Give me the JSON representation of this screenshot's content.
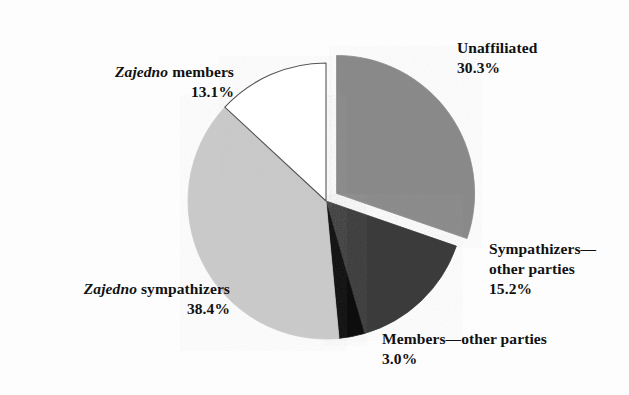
{
  "figure": {
    "background_color": "#fdfdfd",
    "text_color": "#111111"
  },
  "chart_data": {
    "type": "pie",
    "title": "",
    "subtitle": "",
    "xlabel": "",
    "ylabel": "",
    "legend_position": "none",
    "grid": false,
    "units": "percent",
    "total": 100.0,
    "start_angle_deg": 0,
    "direction": "clockwise",
    "categories": [
      "Unaffiliated",
      "Sympathizers—other parties",
      "Members—other parties",
      "Zajedno sympathizers",
      "Zajedno members"
    ],
    "values": [
      30.3,
      15.2,
      3.0,
      38.4,
      13.1
    ],
    "slices": [
      {
        "name": "unaffiliated",
        "label_line1": "Unaffiliated",
        "label_emphasis": "",
        "value": 30.3,
        "value_text": "30.3%",
        "color": "#898989",
        "stroke": "#898989",
        "exploded": true,
        "start_deg": 0.0,
        "end_deg": 109.08
      },
      {
        "name": "sympathizers-other-parties",
        "label_line1": "Sympathizers—",
        "label_line2": "other parties",
        "label_emphasis": "",
        "value": 15.2,
        "value_text": "15.2%",
        "color": "#3a3a3a",
        "stroke": "#3a3a3a",
        "exploded": false,
        "start_deg": 109.08,
        "end_deg": 163.8
      },
      {
        "name": "members-other-parties",
        "label_line1": "Members—other parties",
        "label_emphasis": "",
        "value": 3.0,
        "value_text": "3.0%",
        "color": "#111111",
        "stroke": "#111111",
        "exploded": false,
        "start_deg": 163.8,
        "end_deg": 174.6
      },
      {
        "name": "zajedno-sympathizers",
        "label_emphasis": "Zajedno",
        "label_line1": " sympathizers",
        "value": 38.4,
        "value_text": "38.4%",
        "color": "#c9c9c9",
        "stroke": "#c9c9c9",
        "exploded": false,
        "start_deg": 174.6,
        "end_deg": 312.84
      },
      {
        "name": "zajedno-members",
        "label_emphasis": "Zajedno",
        "label_line1": " members",
        "value": 13.1,
        "value_text": "13.1%",
        "color": "#ffffff",
        "stroke": "#555555",
        "exploded": false,
        "start_deg": 312.84,
        "end_deg": 360.0
      }
    ]
  },
  "labels": {
    "unaffiliated": {
      "text": "Unaffiliated",
      "pct": "30.3%"
    },
    "zajedno_members": {
      "emph": "Zajedno",
      "text": " members",
      "pct": "13.1%"
    },
    "zajedno_sympathizers": {
      "emph": "Zajedno",
      "text": " sympathizers",
      "pct": "38.4%"
    },
    "sympathizers_other": {
      "line1": "Sympathizers—",
      "line2": "other parties",
      "pct": "15.2%"
    },
    "members_other": {
      "text": "Members—other parties",
      "pct": "3.0%"
    }
  }
}
